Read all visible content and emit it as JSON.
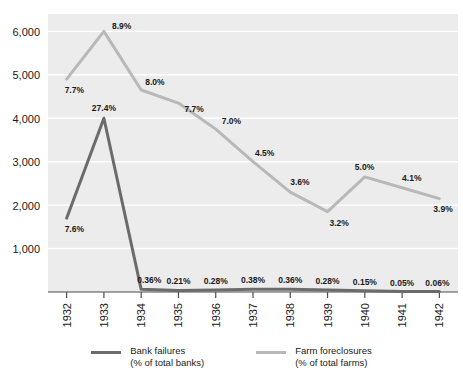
{
  "chart_data": {
    "type": "line",
    "title": "",
    "subtitle": "",
    "xlabel": "",
    "ylabel": "",
    "categories": [
      "1932",
      "1933",
      "1934",
      "1935",
      "1936",
      "1937",
      "1938",
      "1939",
      "1940",
      "1941",
      "1942"
    ],
    "ylim": [
      0,
      6400
    ],
    "yticks": [
      1000,
      2000,
      3000,
      4000,
      5000,
      6000
    ],
    "ytick_labels": [
      "1,000",
      "2,000",
      "3,000",
      "4,000",
      "5,000",
      "6,000"
    ],
    "grid": true,
    "grid_axis": "y",
    "legend_position": "bottom",
    "series": [
      {
        "name": "Bank failures",
        "sublabel": "(% of total banks)",
        "color": "#6b6b6b",
        "values": [
          1700,
          4000,
          61,
          36,
          48,
          65,
          61,
          48,
          26,
          9,
          10
        ],
        "point_labels": [
          "7.6%",
          "27.4%",
          "0.36%",
          "0.21%",
          "0.28%",
          "0.38%",
          "0.36%",
          "0.28%",
          "0.15%",
          "0.05%",
          "0.06%"
        ]
      },
      {
        "name": "Farm foreclosures",
        "sublabel": "(% of total farms)",
        "color": "#b8b8b8",
        "values": [
          4900,
          6000,
          4650,
          4350,
          3750,
          3000,
          2300,
          1850,
          2650,
          2400,
          2150
        ],
        "point_labels": [
          "7.7%",
          "8.9%",
          "8.0%",
          "7.7%",
          "7.0%",
          "4.5%",
          "3.6%",
          "3.2%",
          "5.0%",
          "4.1%",
          "3.9%"
        ]
      }
    ]
  },
  "legend": {
    "items": [
      {
        "name": "Bank failures",
        "sublabel": "(% of total banks)",
        "color": "#6b6b6b"
      },
      {
        "name": "Farm foreclosures",
        "sublabel": "(% of total farms)",
        "color": "#b8b8b8"
      }
    ]
  },
  "style": {
    "plot_background": "#ececec",
    "gridline_color": "#ffffff",
    "axis_color": "#4d4d4d",
    "text_color": "#1a1a1a"
  }
}
